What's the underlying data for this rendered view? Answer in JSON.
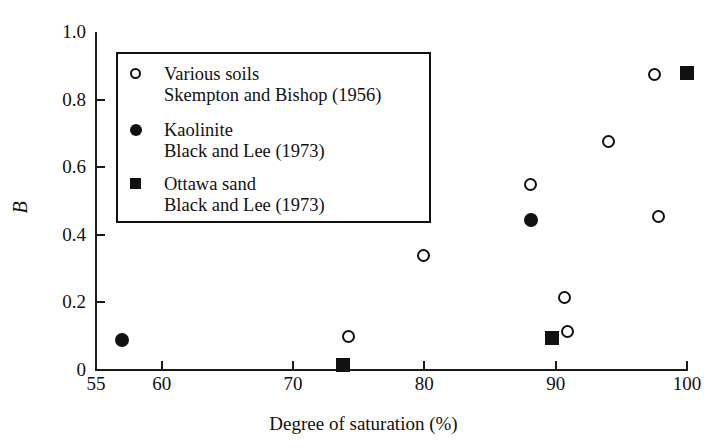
{
  "chart_data": {
    "type": "scatter",
    "title": "",
    "xlabel": "Degree of saturation (%)",
    "ylabel": "B",
    "xlim": [
      55,
      100
    ],
    "ylim": [
      0,
      1.0
    ],
    "xticks": [
      55,
      60,
      70,
      80,
      90,
      100
    ],
    "xticklabels": [
      "55",
      "60",
      "70",
      "80",
      "90",
      "100"
    ],
    "yticks": [
      0,
      0.2,
      0.4,
      0.6,
      0.8,
      1.0
    ],
    "yticklabels": [
      "0",
      "0.2",
      "0.4",
      "0.6",
      "0.8",
      "1.0"
    ],
    "grid": false,
    "legend_position": "upper-left",
    "series": [
      {
        "name": "Various soils",
        "source": "Skempton and Bishop (1956)",
        "marker": "open-circle",
        "color": "#111111",
        "points": [
          {
            "x": 74.2,
            "y": 0.1
          },
          {
            "x": 79.9,
            "y": 0.34
          },
          {
            "x": 88.1,
            "y": 0.55
          },
          {
            "x": 90.7,
            "y": 0.215
          },
          {
            "x": 90.9,
            "y": 0.115
          },
          {
            "x": 94.0,
            "y": 0.675
          },
          {
            "x": 97.8,
            "y": 0.455
          },
          {
            "x": 97.5,
            "y": 0.875
          }
        ]
      },
      {
        "name": "Kaolinite",
        "source": "Black and Lee (1973)",
        "marker": "filled-circle",
        "color": "#111111",
        "points": [
          {
            "x": 57.0,
            "y": 0.09
          },
          {
            "x": 88.1,
            "y": 0.445
          }
        ]
      },
      {
        "name": "Ottawa sand",
        "source": "Black and Lee (1973)",
        "marker": "filled-square",
        "color": "#111111",
        "points": [
          {
            "x": 73.8,
            "y": 0.015
          },
          {
            "x": 89.7,
            "y": 0.095
          },
          {
            "x": 100.0,
            "y": 0.88
          }
        ]
      }
    ],
    "legend": [
      {
        "marker": "open-circle",
        "line1": "Various soils",
        "line2": "Skempton and Bishop (1956)"
      },
      {
        "marker": "filled-circle",
        "line1": "Kaolinite",
        "line2": "Black and Lee (1973)"
      },
      {
        "marker": "filled-square",
        "line1": "Ottawa sand",
        "line2": "Black and Lee (1973)"
      }
    ]
  }
}
